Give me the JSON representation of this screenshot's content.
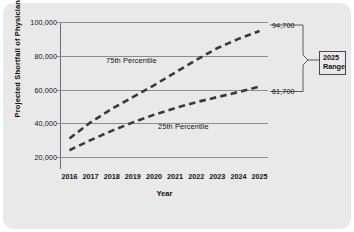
{
  "chart_data": {
    "type": "line",
    "title": "",
    "xlabel": "Year",
    "ylabel": "Projected Shortfall of Physicians",
    "x": [
      2016,
      2017,
      2018,
      2019,
      2020,
      2021,
      2022,
      2023,
      2024,
      2025
    ],
    "xticklabels": [
      "2016",
      "2017",
      "2018",
      "2019",
      "2020",
      "2021",
      "2022",
      "2023",
      "2024",
      "2025"
    ],
    "yticklabels": [
      "100,000",
      "80,000",
      "60,000",
      "40,000",
      "20,000"
    ],
    "yticks": [
      100000,
      80000,
      60000,
      40000,
      20000
    ],
    "ylim": [
      8000,
      100000
    ],
    "xlim": [
      2015.6,
      2025.4
    ],
    "grid": "horizontal",
    "legend": "inline-labels",
    "series": [
      {
        "name": "75th Percentile",
        "linestyle": "dashed",
        "color": "#3a3a3a",
        "values": [
          31000,
          40500,
          48500,
          55500,
          62500,
          70000,
          77500,
          84500,
          90000,
          94700
        ],
        "end_value": 94700,
        "end_label": "94,700"
      },
      {
        "name": "25th Percentile",
        "linestyle": "dashed",
        "color": "#3a3a3a",
        "values": [
          24000,
          30000,
          35500,
          40500,
          45000,
          49000,
          52500,
          55500,
          58500,
          61700
        ],
        "end_value": 61700,
        "end_label": "61,700"
      }
    ],
    "annotations": {
      "bracket_label_line1": "2025",
      "bracket_label_line2": "Range",
      "bracket_top_value": "94,700",
      "bracket_bottom_value": "61,700"
    },
    "colors": {
      "panel_background": "#e9e9e9",
      "gridline": "#8d8d8d",
      "series_line": "#3a3a3a",
      "text": "#111111",
      "bracket": "#4a4a4a"
    }
  }
}
